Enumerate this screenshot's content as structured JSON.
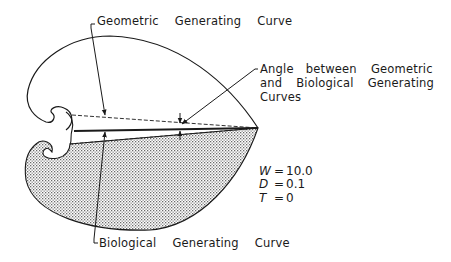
{
  "labels": {
    "geometric_curve": [
      "Geometric",
      "Generating",
      "Curve"
    ],
    "biological_curve": [
      "Biological",
      "Generating",
      "Curve"
    ],
    "angle": {
      "line1": [
        "Angle",
        "between",
        "Geometric"
      ],
      "line2": [
        "and",
        "Biological",
        "Generating"
      ],
      "line3": "Curves"
    }
  },
  "parameters": [
    {
      "symbol": "W",
      "eq": "=",
      "value": "10.0"
    },
    {
      "symbol": "D",
      "eq": "=",
      "value": "0.1"
    },
    {
      "symbol": "T",
      "eq": "=",
      "value": "0"
    }
  ],
  "colors": {
    "line": "#1a1a1a",
    "stipple": "#8a8a8a",
    "background": "#ffffff"
  }
}
